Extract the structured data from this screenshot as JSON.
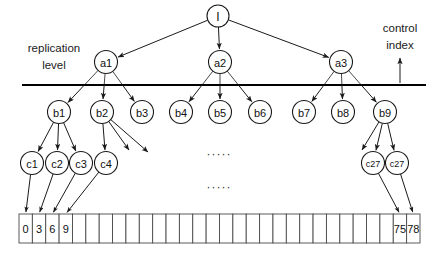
{
  "diagram": {
    "labels": {
      "replication_level_line1": "replication",
      "replication_level_line2": "level",
      "control_index_line1": "control",
      "control_index_line2": "index"
    },
    "ellipsis": "·····",
    "colors": {
      "stroke": "#1a1a1a",
      "line": "#000000",
      "cell_stroke": "#4a4a4a",
      "background": "#ffffff",
      "text": "#111111"
    },
    "root": {
      "id": "root",
      "label": "I",
      "cx": 218,
      "cy": 16,
      "r": 11
    },
    "level_a": [
      {
        "id": "a1",
        "label": "a1",
        "cx": 106,
        "cy": 62,
        "r": 11.5
      },
      {
        "id": "a2",
        "label": "a2",
        "cx": 220,
        "cy": 62,
        "r": 11.5
      },
      {
        "id": "a3",
        "label": "a3",
        "cx": 341,
        "cy": 62,
        "r": 11.5
      }
    ],
    "level_b": [
      {
        "id": "b1",
        "label": "b1",
        "cx": 59,
        "cy": 112,
        "r": 11.5
      },
      {
        "id": "b2",
        "label": "b2",
        "cx": 102,
        "cy": 112,
        "r": 11.5
      },
      {
        "id": "b3",
        "label": "b3",
        "cx": 142,
        "cy": 112,
        "r": 11.5
      },
      {
        "id": "b4",
        "label": "b4",
        "cx": 181,
        "cy": 112,
        "r": 11.5
      },
      {
        "id": "b5",
        "label": "b5",
        "cx": 220,
        "cy": 112,
        "r": 11.5
      },
      {
        "id": "b6",
        "label": "b6",
        "cx": 260,
        "cy": 112,
        "r": 11.5
      },
      {
        "id": "b7",
        "label": "b7",
        "cx": 304,
        "cy": 112,
        "r": 11.5
      },
      {
        "id": "b8",
        "label": "b8",
        "cx": 343,
        "cy": 112,
        "r": 11.5
      },
      {
        "id": "b9",
        "label": "b9",
        "cx": 385,
        "cy": 112,
        "r": 11.5
      }
    ],
    "level_c": [
      {
        "id": "c1",
        "label": "c1",
        "cx": 32,
        "cy": 163,
        "r": 11.5
      },
      {
        "id": "c2",
        "label": "c2",
        "cx": 57,
        "cy": 163,
        "r": 11.5
      },
      {
        "id": "c3",
        "label": "c3",
        "cx": 81,
        "cy": 163,
        "r": 11.5
      },
      {
        "id": "c4",
        "label": "c4",
        "cx": 106,
        "cy": 163,
        "r": 11.5
      },
      {
        "id": "c27a",
        "label": "c27",
        "cx": 373,
        "cy": 163,
        "r": 11.5
      },
      {
        "id": "c27b",
        "label": "c27",
        "cx": 397,
        "cy": 163,
        "r": 11.5
      }
    ],
    "horizontal_line": {
      "x1": 22,
      "x2": 426,
      "y": 85
    },
    "control_index_arrow": {
      "x": 400,
      "y_top": 58,
      "y_bottom": 83
    },
    "array": {
      "x": 19,
      "y": 214,
      "width": 401,
      "height": 29,
      "cell_count": 30,
      "cells": [
        {
          "index": 0,
          "value": "0"
        },
        {
          "index": 1,
          "value": "3"
        },
        {
          "index": 2,
          "value": "6"
        },
        {
          "index": 3,
          "value": "9"
        },
        {
          "index": 4,
          "value": ""
        },
        {
          "index": 5,
          "value": ""
        },
        {
          "index": 6,
          "value": ""
        },
        {
          "index": 7,
          "value": ""
        },
        {
          "index": 8,
          "value": ""
        },
        {
          "index": 9,
          "value": ""
        },
        {
          "index": 10,
          "value": ""
        },
        {
          "index": 11,
          "value": ""
        },
        {
          "index": 12,
          "value": ""
        },
        {
          "index": 13,
          "value": ""
        },
        {
          "index": 14,
          "value": ""
        },
        {
          "index": 15,
          "value": ""
        },
        {
          "index": 16,
          "value": ""
        },
        {
          "index": 17,
          "value": ""
        },
        {
          "index": 18,
          "value": ""
        },
        {
          "index": 19,
          "value": ""
        },
        {
          "index": 20,
          "value": ""
        },
        {
          "index": 21,
          "value": ""
        },
        {
          "index": 22,
          "value": ""
        },
        {
          "index": 23,
          "value": ""
        },
        {
          "index": 24,
          "value": ""
        },
        {
          "index": 25,
          "value": ""
        },
        {
          "index": 26,
          "value": ""
        },
        {
          "index": 27,
          "value": ""
        },
        {
          "index": 28,
          "value": "75"
        },
        {
          "index": 29,
          "value": "78"
        }
      ]
    },
    "edges_root_to_a": [
      {
        "from": "root",
        "to": "a1"
      },
      {
        "from": "root",
        "to": "a2"
      },
      {
        "from": "root",
        "to": "a3"
      }
    ],
    "edges_a_to_b": [
      {
        "from": "a1",
        "to": "b1"
      },
      {
        "from": "a1",
        "to": "b2"
      },
      {
        "from": "a1",
        "to": "b3"
      },
      {
        "from": "a2",
        "to": "b4"
      },
      {
        "from": "a2",
        "to": "b5"
      },
      {
        "from": "a2",
        "to": "b6"
      },
      {
        "from": "a3",
        "to": "b7"
      },
      {
        "from": "a3",
        "to": "b8"
      },
      {
        "from": "a3",
        "to": "b9"
      }
    ],
    "edges_b_to_c": [
      {
        "from": "b1",
        "to": "c1"
      },
      {
        "from": "b1",
        "to": "c2"
      },
      {
        "from": "b1",
        "to": "c3"
      },
      {
        "from": "b2",
        "to": "c4"
      },
      {
        "from": "b9",
        "to": "c27a"
      },
      {
        "from": "b9",
        "to": "c27b"
      }
    ],
    "edges_b2_dangling": [
      {
        "from": "b2",
        "tip_x": 129,
        "tip_y": 150
      },
      {
        "from": "b2",
        "tip_x": 148,
        "tip_y": 152
      }
    ],
    "edges_b9_dangling": [
      {
        "from": "b9",
        "tip_x": 362,
        "tip_y": 150
      }
    ],
    "edges_c_to_cell": [
      {
        "from": "c1",
        "cell": 0
      },
      {
        "from": "c2",
        "cell": 1
      },
      {
        "from": "c3",
        "cell": 2
      },
      {
        "from": "c4",
        "cell": 3
      },
      {
        "from": "c27a",
        "cell": 28
      },
      {
        "from": "c27b",
        "cell": 29
      }
    ],
    "ellipses": [
      {
        "cx": 219,
        "cy": 158
      },
      {
        "cx": 219,
        "cy": 191
      }
    ]
  }
}
